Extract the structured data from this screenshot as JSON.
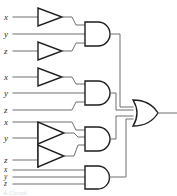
{
  "figure": {
    "caption": "A Circuit",
    "background_color": "#ffffff",
    "wire_color": "#6e6e6e",
    "gate_outline_color": "#1d1d1d"
  },
  "inputs": {
    "group1": [
      {
        "label": "x",
        "x": 6,
        "y": 18,
        "inverted": true
      },
      {
        "label": "y",
        "x": 6,
        "y": 34,
        "inverted": false
      },
      {
        "label": "z",
        "x": 6,
        "y": 52,
        "inverted": true
      }
    ],
    "group2": [
      {
        "label": "x",
        "x": 6,
        "y": 77,
        "inverted": true
      },
      {
        "label": "y",
        "x": 6,
        "y": 93,
        "inverted": false
      },
      {
        "label": "z",
        "x": 6,
        "y": 110,
        "inverted": false
      }
    ],
    "group3": [
      {
        "label": "x",
        "x": 6,
        "y": 122,
        "inverted": false
      },
      {
        "label": "y",
        "x": 6,
        "y": 138,
        "inverted": true
      },
      {
        "label": "z",
        "x": 6,
        "y": 160,
        "inverted": true
      }
    ],
    "group4": [
      {
        "label": "x",
        "x": 6,
        "y": 170,
        "inverted": false
      },
      {
        "label": "y",
        "x": 6,
        "y": 177,
        "inverted": false
      },
      {
        "label": "z",
        "x": 6,
        "y": 184,
        "inverted": false
      }
    ]
  },
  "gates": {
    "inverters": [
      {
        "name": "inverter-x1",
        "cx": 52,
        "cy": 17
      },
      {
        "name": "inverter-z1",
        "cx": 52,
        "cy": 51
      },
      {
        "name": "inverter-x2",
        "cx": 52,
        "cy": 77
      },
      {
        "name": "inverter-y3",
        "cx": 52,
        "cy": 133
      },
      {
        "name": "inverter-z3",
        "cx": 52,
        "cy": 155
      }
    ],
    "and_gates": [
      {
        "name": "and-gate-1",
        "x": 84,
        "y": 22,
        "inputs": [
          "x-not",
          "y",
          "z-not"
        ]
      },
      {
        "name": "and-gate-2",
        "x": 84,
        "y": 81,
        "inputs": [
          "x-not",
          "y",
          "z"
        ]
      },
      {
        "name": "and-gate-3",
        "x": 84,
        "y": 127,
        "inputs": [
          "x",
          "y-not",
          "z-not"
        ]
      },
      {
        "name": "and-gate-4",
        "x": 84,
        "y": 166,
        "inputs": [
          "x",
          "y",
          "z"
        ]
      }
    ],
    "or_gate": {
      "name": "or-gate-output",
      "x": 133,
      "y": 100,
      "inputs": 4
    }
  },
  "output": {
    "name": "circuit-output",
    "x": 160,
    "y": 113
  },
  "labels": {
    "x": "x",
    "y": "y",
    "z": "z"
  }
}
